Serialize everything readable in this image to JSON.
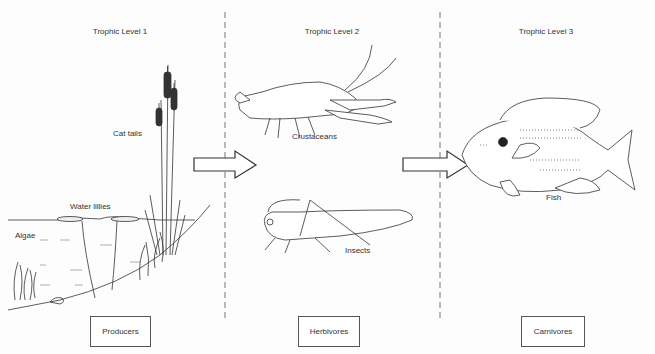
{
  "columns": [
    {
      "title": "Trophic Level 1",
      "category": "Producers"
    },
    {
      "title": "Trophic Level 2",
      "category": "Herbivores"
    },
    {
      "title": "Trophic Level 3",
      "category": "Carnivores"
    }
  ],
  "labels": {
    "cat_tails": "Cat tails",
    "water_lillies": "Water lillies",
    "algae": "Algae",
    "crustaceans": "Crustaceans",
    "insects": "Insects",
    "fish": "Fish"
  }
}
